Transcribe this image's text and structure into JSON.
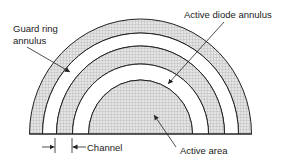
{
  "diagram": {
    "labels": {
      "guard_ring_line1": "Guard ring",
      "guard_ring_line2": "annulus",
      "active_diode": "Active diode annulus",
      "channel": "Channel",
      "active_area": "Active area"
    },
    "colors": {
      "stroke": "#222222",
      "hatch_fill": "#d8d8d8",
      "hatch_line": "#9a9a9a",
      "background": "#ffffff"
    },
    "geometry": {
      "center_x": 140.5,
      "baseline_y": 134,
      "rings": [
        {
          "name": "guard-ring-annulus",
          "rx_outer": 111,
          "ry_outer": 115,
          "rx_inner": 98,
          "ry_inner": 101,
          "filled": true
        },
        {
          "name": "channel-gap-outer",
          "rx_outer": 98,
          "ry_outer": 101,
          "rx_inner": 84,
          "ry_inner": 88,
          "filled": false
        },
        {
          "name": "active-diode-annulus",
          "rx_outer": 84,
          "ry_outer": 88,
          "rx_inner": 68,
          "ry_inner": 70,
          "filled": true
        },
        {
          "name": "channel-gap-inner",
          "rx_outer": 68,
          "ry_outer": 70,
          "rx_inner": 52,
          "ry_inner": 54,
          "filled": false
        },
        {
          "name": "active-area",
          "rx_outer": 52,
          "ry_outer": 54,
          "filled": true
        }
      ]
    }
  }
}
